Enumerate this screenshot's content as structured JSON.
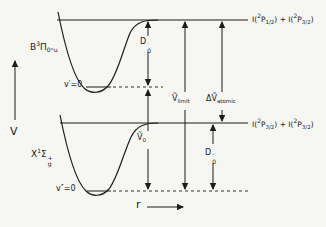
{
  "figure": {
    "type": "potential-energy-diagram",
    "background": "#f6f6f3",
    "ink": "#1c1c1c"
  },
  "axes": {
    "v_label": "V",
    "r_label": "r"
  },
  "states": {
    "b": {
      "main": "B",
      "sup": "3",
      "letter": "Π",
      "sub": "0⁺u"
    },
    "x": {
      "main": "X",
      "sup": "1",
      "letter": "Σ",
      "stack_top": "+",
      "stack_bottom": "g"
    }
  },
  "levels": {
    "v_prime": "v′=0",
    "v_double_prime": "v″=0"
  },
  "limits": {
    "upper": {
      "pre1": "I(",
      "sup1": "2",
      "sym1": "P",
      "sub1": "1/2",
      "mid": ") + I(",
      "sup2": "2",
      "sym2": "P",
      "sub2": "3/2",
      "post": ")"
    },
    "lower": {
      "pre1": "I(",
      "sup1": "2",
      "sym1": "P",
      "sub1": "3/2",
      "mid": ") + I(",
      "sup2": "2",
      "sym2": "P",
      "sub2": "3/2",
      "post": ")"
    }
  },
  "arrows": {
    "d0_prime": {
      "main": "D",
      "top": "′",
      "bottom": "0"
    },
    "nu0": {
      "main": "Ṽ",
      "bottom": "0"
    },
    "nu_limit": {
      "main": "Ṽ",
      "bottom": "limit"
    },
    "delta_nu_atomic": {
      "main": "ΔṼ",
      "bottom": "atomic"
    },
    "d0_double_prime": {
      "main": "D",
      "top": "″",
      "bottom": "0"
    }
  }
}
